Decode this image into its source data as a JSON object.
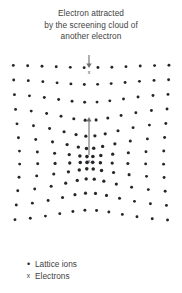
{
  "figure": {
    "caption_lines": [
      "Electron attracted",
      "by the screening cloud of",
      "another electron"
    ]
  },
  "legend": {
    "items": [
      {
        "symbol": "•",
        "label": "Lattice ions",
        "kind": "dot"
      },
      {
        "symbol": "x",
        "label": "Electrons",
        "kind": "x"
      }
    ]
  },
  "diagram_data": {
    "type": "scatter",
    "description": "Square lattice of ions radially compressed toward a central screening electron; a second electron above is attracted downward toward the screening cloud.",
    "colors": {
      "ion": "#262626",
      "arrow": "#6e6e6e",
      "electron": "#3a3a3a",
      "text": "#3f3f3f",
      "background": "#ffffff"
    },
    "lattice": {
      "nominal_spacing": 14.2,
      "columns": 12,
      "rows": 12,
      "origin_x": 13,
      "origin_y": 10,
      "center": {
        "x": 89,
        "y": 106
      },
      "distortion": {
        "model": "radial-compression",
        "strength": 0.62,
        "radius": 74
      }
    },
    "electrons": [
      {
        "id": "incoming-electron",
        "symbol": "x",
        "x": 89,
        "y": 17
      },
      {
        "id": "screening-electron",
        "symbol": "x",
        "x": 89,
        "y": 106
      }
    ],
    "arrows": [
      {
        "id": "attraction-arrow",
        "direction": "down",
        "x": 89,
        "y1": -4,
        "y2": 13
      },
      {
        "id": "screening-arrow",
        "direction": "up",
        "x": 89,
        "y1": 100,
        "y2": 62
      }
    ]
  }
}
